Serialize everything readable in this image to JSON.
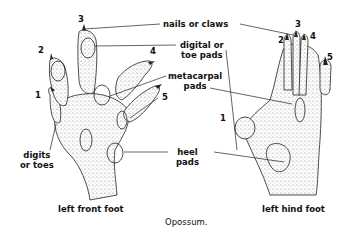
{
  "caption": "Opossum.",
  "front_foot": {
    "title": "left front foot",
    "digit_numbers": [
      "1",
      "2",
      "3",
      "4",
      "5"
    ]
  },
  "hind_foot": {
    "title": "left hind foot",
    "digit_numbers": [
      "1",
      "2",
      "3",
      "4",
      "5"
    ]
  },
  "labels": {
    "nails": "nails or claws",
    "digital_pads_l1": "digital or",
    "digital_pads_l2": "toe pads",
    "metacarpal_l1": "metacarpal",
    "metacarpal_l2": "pads",
    "heel_l1": "heel",
    "heel_l2": "pads",
    "digits_l1": "digits",
    "digits_l2": "or toes"
  },
  "colors": {
    "ink": "#111111",
    "stipple": "#9a9a9a",
    "background": "#ffffff"
  }
}
